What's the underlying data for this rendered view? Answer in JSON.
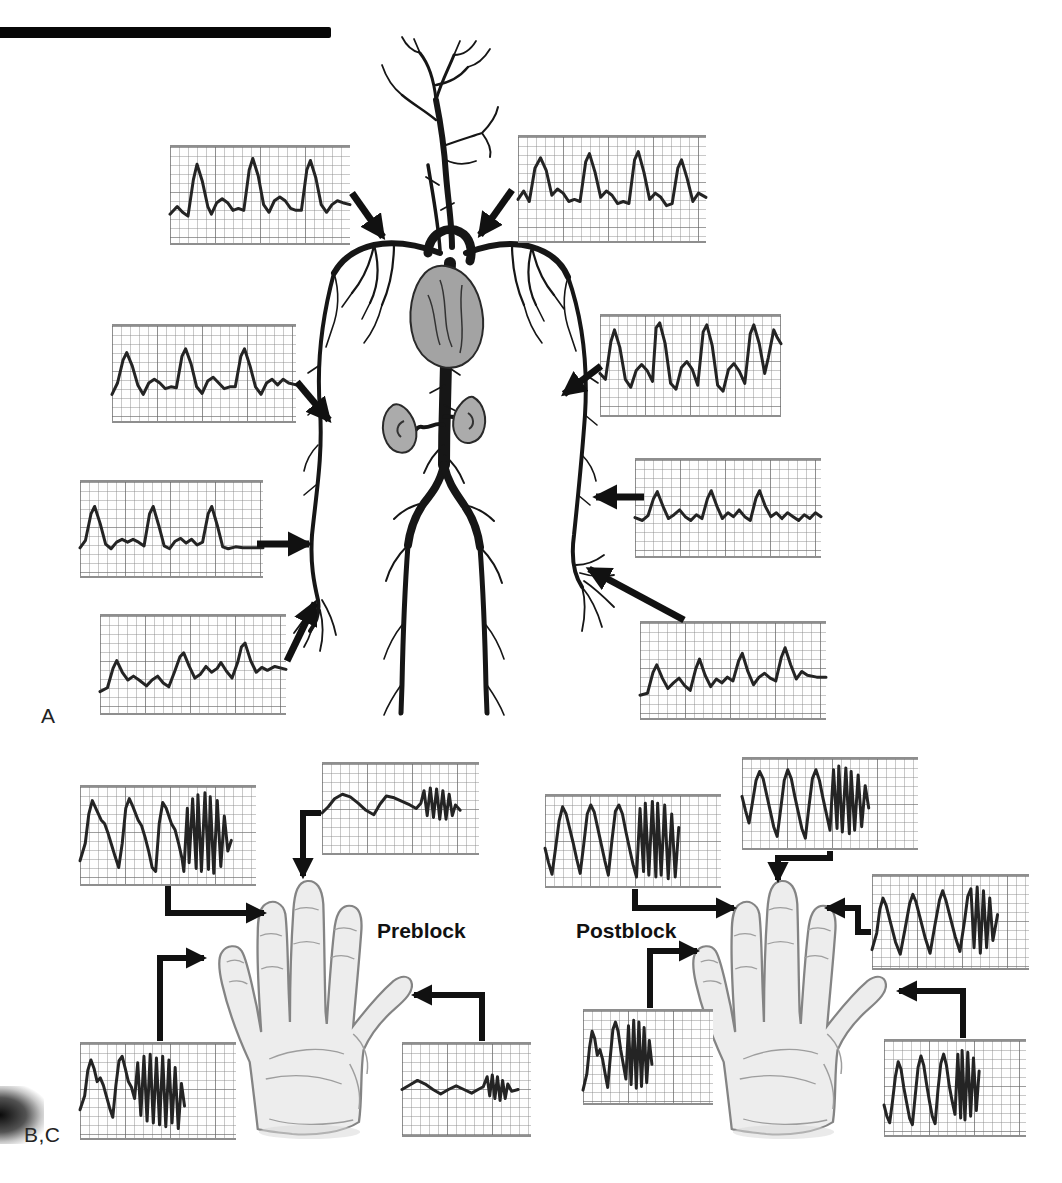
{
  "labels": {
    "panel_a": "A",
    "panel_bc": "B,C",
    "preblock": "Preblock",
    "postblock": "Postblock"
  },
  "colors": {
    "ink": "#242424",
    "grid_minor": "#878787",
    "grid_major": "#5f5f5f",
    "organ_fill": "#a3a3a3",
    "hand_fill": "#ededed",
    "artifact": "#070707"
  },
  "chart_data": {
    "type": "line",
    "note": "Unlabeled strip-chart pulse waveforms on graph-paper grid; normalized 0-100 coordinates, y=0 is top"
  },
  "waveforms": {
    "a1": {
      "points": [
        0,
        70,
        4,
        62,
        7,
        68,
        10,
        72,
        13,
        34,
        15,
        18,
        18,
        36,
        21,
        62,
        23,
        70,
        26,
        58,
        29,
        54,
        32,
        58,
        35,
        66,
        38,
        64,
        41,
        66,
        44,
        24,
        46,
        12,
        49,
        30,
        52,
        60,
        55,
        68,
        58,
        56,
        61,
        52,
        64,
        56,
        67,
        64,
        70,
        66,
        73,
        66,
        76,
        24,
        78,
        14,
        81,
        32,
        84,
        60,
        87,
        68,
        90,
        60,
        93,
        56,
        96,
        58,
        100,
        60
      ]
    },
    "a2": {
      "points": [
        0,
        60,
        3,
        52,
        6,
        62,
        9,
        30,
        12,
        20,
        15,
        32,
        18,
        56,
        21,
        50,
        24,
        54,
        27,
        62,
        30,
        60,
        33,
        62,
        36,
        24,
        38,
        16,
        41,
        34,
        44,
        58,
        47,
        52,
        50,
        56,
        53,
        64,
        56,
        62,
        59,
        64,
        62,
        22,
        64,
        14,
        67,
        34,
        70,
        60,
        73,
        54,
        76,
        58,
        79,
        66,
        82,
        64,
        85,
        30,
        87,
        22,
        90,
        40,
        93,
        62,
        96,
        54,
        100,
        58
      ]
    },
    "a3": {
      "points": [
        0,
        72,
        3,
        60,
        6,
        36,
        8,
        28,
        11,
        42,
        14,
        62,
        17,
        72,
        20,
        60,
        23,
        56,
        26,
        60,
        29,
        66,
        32,
        64,
        35,
        65,
        38,
        32,
        40,
        24,
        43,
        40,
        46,
        64,
        49,
        71,
        52,
        58,
        55,
        54,
        58,
        60,
        61,
        66,
        64,
        64,
        67,
        64,
        70,
        32,
        72,
        24,
        75,
        42,
        78,
        64,
        81,
        72,
        84,
        60,
        87,
        56,
        90,
        62,
        93,
        56,
        96,
        60,
        100,
        62
      ]
    },
    "a4": {
      "points": [
        0,
        70,
        3,
        62,
        6,
        34,
        8,
        26,
        11,
        44,
        14,
        66,
        17,
        71,
        20,
        64,
        23,
        61,
        26,
        64,
        29,
        61,
        32,
        64,
        35,
        68,
        38,
        34,
        40,
        26,
        43,
        46,
        46,
        68,
        49,
        71,
        52,
        63,
        55,
        60,
        58,
        65,
        61,
        61,
        64,
        67,
        67,
        64,
        70,
        34,
        72,
        26,
        75,
        46,
        78,
        69,
        81,
        71,
        85,
        69,
        89,
        70,
        94,
        70,
        100,
        70
      ]
    },
    "a5": {
      "points": [
        0,
        78,
        4,
        74,
        7,
        54,
        9,
        46,
        12,
        58,
        15,
        66,
        18,
        62,
        21,
        66,
        25,
        72,
        28,
        66,
        31,
        62,
        34,
        69,
        37,
        73,
        40,
        58,
        43,
        42,
        45,
        38,
        48,
        52,
        51,
        64,
        54,
        60,
        57,
        52,
        60,
        58,
        63,
        54,
        65,
        48,
        68,
        57,
        71,
        64,
        74,
        48,
        76,
        32,
        78,
        28,
        81,
        46,
        84,
        58,
        87,
        53,
        90,
        56,
        94,
        52,
        100,
        55
      ]
    },
    "a6": {
      "points": [
        0,
        58,
        3,
        64,
        6,
        26,
        8,
        14,
        11,
        32,
        14,
        64,
        17,
        72,
        20,
        55,
        23,
        49,
        26,
        55,
        29,
        66,
        31,
        12,
        33,
        7,
        36,
        28,
        39,
        68,
        42,
        74,
        45,
        52,
        48,
        46,
        51,
        54,
        54,
        70,
        57,
        16,
        59,
        9,
        62,
        30,
        65,
        70,
        68,
        76,
        71,
        54,
        74,
        48,
        77,
        56,
        80,
        68,
        83,
        18,
        85,
        9,
        88,
        28,
        91,
        58,
        93,
        42,
        96,
        14,
        98,
        22,
        100,
        28
      ]
    },
    "a7": {
      "points": [
        0,
        60,
        4,
        63,
        7,
        58,
        10,
        40,
        12,
        33,
        15,
        48,
        18,
        61,
        21,
        57,
        24,
        52,
        27,
        59,
        30,
        63,
        33,
        57,
        36,
        61,
        39,
        40,
        41,
        32,
        44,
        48,
        47,
        61,
        50,
        55,
        53,
        59,
        56,
        52,
        59,
        59,
        62,
        63,
        65,
        40,
        67,
        32,
        70,
        48,
        73,
        59,
        76,
        55,
        79,
        61,
        82,
        55,
        85,
        59,
        88,
        63,
        91,
        57,
        94,
        61,
        97,
        55,
        100,
        59
      ]
    },
    "a8": {
      "points": [
        0,
        76,
        4,
        74,
        7,
        52,
        9,
        44,
        12,
        58,
        15,
        69,
        18,
        63,
        21,
        58,
        24,
        66,
        27,
        71,
        30,
        48,
        32,
        38,
        35,
        55,
        38,
        67,
        41,
        59,
        44,
        63,
        47,
        57,
        50,
        61,
        53,
        40,
        55,
        32,
        58,
        51,
        61,
        65,
        64,
        57,
        67,
        53,
        70,
        58,
        73,
        61,
        76,
        36,
        78,
        26,
        81,
        44,
        84,
        59,
        87,
        51,
        90,
        55,
        95,
        57,
        100,
        57
      ]
    },
    "b1": {
      "points": [
        0,
        76,
        3,
        58,
        5,
        28,
        7,
        14,
        9,
        22,
        12,
        34,
        14,
        38,
        16,
        48,
        18,
        60,
        20,
        72,
        22,
        83,
        24,
        58,
        26,
        22,
        28,
        12,
        30,
        20,
        33,
        34,
        35,
        40,
        37,
        52,
        39,
        66,
        41,
        83,
        43,
        87,
        45,
        38,
        47,
        16,
        49,
        22,
        52,
        38,
        54,
        44,
        56,
        58,
        58,
        74,
        59,
        87,
        61,
        22,
        62,
        78,
        64,
        12,
        66,
        84,
        67,
        8,
        69,
        87,
        71,
        6,
        73,
        85,
        74,
        10,
        76,
        89,
        78,
        14,
        80,
        82,
        82,
        30,
        84,
        66,
        86,
        55
      ]
    },
    "b2": {
      "points": [
        0,
        55,
        4,
        48,
        8,
        39,
        13,
        34,
        18,
        37,
        23,
        44,
        28,
        52,
        33,
        57,
        37,
        45,
        41,
        36,
        46,
        38,
        51,
        42,
        56,
        46,
        60,
        50,
        63,
        44,
        65,
        30,
        67,
        58,
        69,
        27,
        71,
        60,
        73,
        28,
        75,
        62,
        77,
        30,
        79,
        62,
        81,
        34,
        83,
        58,
        85,
        46,
        88,
        52
      ]
    },
    "b3": {
      "points": [
        0,
        70,
        3,
        55,
        5,
        28,
        7,
        17,
        9,
        26,
        11,
        40,
        13,
        36,
        15,
        44,
        17,
        56,
        19,
        68,
        21,
        78,
        23,
        44,
        25,
        18,
        27,
        13,
        29,
        26,
        31,
        40,
        33,
        46,
        35,
        58,
        37,
        20,
        39,
        76,
        41,
        13,
        43,
        82,
        45,
        11,
        47,
        84,
        49,
        15,
        51,
        86,
        53,
        13,
        55,
        88,
        57,
        17,
        59,
        84,
        61,
        25,
        63,
        90,
        65,
        42,
        67,
        66
      ]
    },
    "b4": {
      "points": [
        0,
        50,
        6,
        45,
        12,
        40,
        18,
        44,
        24,
        50,
        30,
        55,
        36,
        50,
        42,
        46,
        48,
        50,
        54,
        54,
        59,
        50,
        63,
        47,
        66,
        36,
        68,
        57,
        70,
        34,
        72,
        60,
        74,
        36,
        76,
        62,
        78,
        40,
        80,
        60,
        82,
        44,
        85,
        52,
        90,
        50
      ]
    },
    "c1": {
      "points": [
        0,
        58,
        2,
        74,
        4,
        87,
        6,
        58,
        8,
        28,
        10,
        12,
        12,
        20,
        14,
        36,
        16,
        52,
        18,
        70,
        20,
        86,
        22,
        54,
        24,
        20,
        26,
        10,
        28,
        18,
        30,
        36,
        32,
        54,
        34,
        72,
        36,
        88,
        38,
        50,
        40,
        17,
        42,
        10,
        44,
        20,
        46,
        40,
        48,
        58,
        50,
        76,
        52,
        90,
        54,
        14,
        56,
        84,
        57,
        8,
        59,
        88,
        61,
        6,
        63,
        90,
        64,
        8,
        66,
        88,
        68,
        10,
        70,
        92,
        72,
        20,
        74,
        90,
        76,
        35
      ]
    },
    "c2": {
      "points": [
        0,
        42,
        2,
        58,
        4,
        72,
        6,
        48,
        8,
        24,
        10,
        14,
        12,
        22,
        14,
        40,
        16,
        58,
        18,
        76,
        20,
        87,
        22,
        56,
        24,
        24,
        26,
        12,
        28,
        22,
        30,
        42,
        32,
        60,
        34,
        78,
        36,
        89,
        38,
        54,
        40,
        22,
        42,
        12,
        44,
        24,
        46,
        44,
        48,
        62,
        50,
        80,
        52,
        12,
        54,
        78,
        55,
        8,
        57,
        82,
        59,
        10,
        61,
        84,
        62,
        14,
        64,
        80,
        66,
        18,
        68,
        76,
        70,
        30,
        72,
        55
      ]
    },
    "c3": {
      "points": [
        0,
        80,
        3,
        62,
        5,
        36,
        7,
        24,
        9,
        32,
        12,
        52,
        15,
        72,
        18,
        85,
        21,
        58,
        24,
        30,
        26,
        20,
        28,
        28,
        31,
        48,
        34,
        68,
        37,
        84,
        40,
        54,
        43,
        26,
        45,
        16,
        47,
        26,
        50,
        46,
        53,
        66,
        56,
        82,
        59,
        48,
        61,
        22,
        63,
        14,
        65,
        78,
        67,
        12,
        69,
        84,
        71,
        16,
        73,
        78,
        75,
        24,
        77,
        70,
        80,
        42
      ]
    },
    "c4": {
      "points": [
        0,
        86,
        3,
        68,
        5,
        40,
        7,
        22,
        9,
        30,
        11,
        48,
        13,
        42,
        15,
        52,
        17,
        68,
        19,
        83,
        21,
        50,
        23,
        20,
        25,
        12,
        27,
        22,
        29,
        42,
        31,
        58,
        33,
        74,
        35,
        16,
        37,
        80,
        39,
        10,
        41,
        84,
        43,
        12,
        45,
        82,
        47,
        18,
        49,
        78,
        51,
        32,
        53,
        58
      ]
    },
    "c5": {
      "points": [
        0,
        68,
        2,
        80,
        4,
        87,
        6,
        64,
        8,
        38,
        10,
        22,
        12,
        30,
        14,
        50,
        16,
        66,
        18,
        82,
        20,
        89,
        22,
        58,
        24,
        28,
        26,
        16,
        28,
        26,
        30,
        46,
        32,
        64,
        34,
        80,
        36,
        88,
        38,
        52,
        40,
        24,
        42,
        14,
        44,
        26,
        46,
        48,
        48,
        64,
        50,
        78,
        52,
        14,
        54,
        82,
        55,
        10,
        57,
        84,
        59,
        12,
        61,
        80,
        63,
        18,
        65,
        74,
        67,
        32
      ]
    }
  }
}
